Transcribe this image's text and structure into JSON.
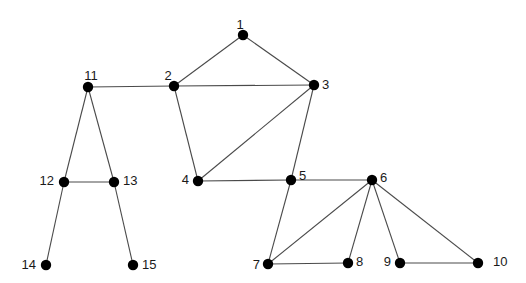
{
  "diagram": {
    "type": "undirected-graph",
    "nodes": [
      {
        "id": "1",
        "label": "1"
      },
      {
        "id": "2",
        "label": "2"
      },
      {
        "id": "3",
        "label": "3"
      },
      {
        "id": "4",
        "label": "4"
      },
      {
        "id": "5",
        "label": "5"
      },
      {
        "id": "6",
        "label": "6"
      },
      {
        "id": "7",
        "label": "7"
      },
      {
        "id": "8",
        "label": "8"
      },
      {
        "id": "9",
        "label": "9"
      },
      {
        "id": "10",
        "label": "10"
      },
      {
        "id": "11",
        "label": "11"
      },
      {
        "id": "12",
        "label": "12"
      },
      {
        "id": "13",
        "label": "13"
      },
      {
        "id": "14",
        "label": "14"
      },
      {
        "id": "15",
        "label": "15"
      }
    ],
    "edges": [
      [
        "1",
        "2"
      ],
      [
        "1",
        "3"
      ],
      [
        "2",
        "3"
      ],
      [
        "2",
        "4"
      ],
      [
        "3",
        "4"
      ],
      [
        "3",
        "5"
      ],
      [
        "4",
        "5"
      ],
      [
        "5",
        "6"
      ],
      [
        "5",
        "7"
      ],
      [
        "6",
        "7"
      ],
      [
        "6",
        "8"
      ],
      [
        "6",
        "9"
      ],
      [
        "6",
        "10"
      ],
      [
        "7",
        "8"
      ],
      [
        "9",
        "10"
      ],
      [
        "11",
        "2"
      ],
      [
        "11",
        "12"
      ],
      [
        "11",
        "13"
      ],
      [
        "12",
        "13"
      ],
      [
        "12",
        "14"
      ],
      [
        "13",
        "15"
      ]
    ],
    "colors": {
      "node": "#000000",
      "edge": "#4a4a4a",
      "label": "#1a1a1a",
      "background": "#ffffff"
    }
  }
}
